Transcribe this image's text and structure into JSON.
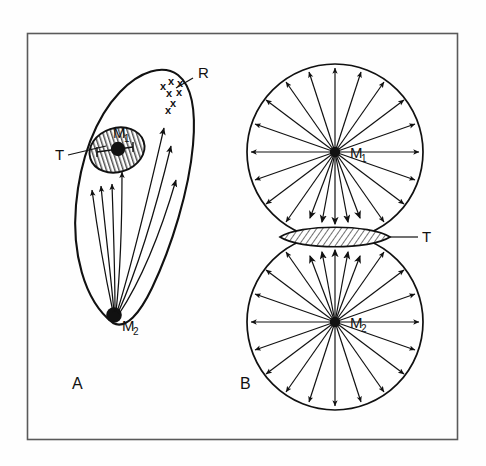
{
  "figure": {
    "background_color": "#fefefe",
    "frame": {
      "name": "outer-frame",
      "x": 27,
      "y": 33,
      "width": 431,
      "height": 407,
      "stroke": "#555555"
    },
    "panels": [
      {
        "id": "A",
        "label": "A",
        "label_x": 72,
        "label_y": 389,
        "description": "Elongated leaf-shaped region R containing hatched target area T with metastasis M1, and primary tumour M2 at the base, with arrows indicating flow from M2 towards M1 and towards the x-marked zone.",
        "outline_name": "region-r-outline",
        "elements": {
          "label_R": "R",
          "label_R_x": 198,
          "label_R_y": 74,
          "label_T": "T",
          "label_T_x": 57,
          "label_T_y": 156,
          "label_M1": "M",
          "label_M1_sub": "1",
          "label_M1_x": 115,
          "label_M1_y": 136,
          "label_M2": "M",
          "label_M2_sub": "2",
          "label_M2_x": 122,
          "label_M2_y": 328,
          "x_marks_count": 7
        }
      },
      {
        "id": "B",
        "label": "B",
        "label_x": 240,
        "label_y": 389,
        "description": "Two tangent circles with radial arrows emanating from their centres M1 (upper) and M2 (lower); the overlapping hatched lens between them is the shared target region T.",
        "elements": {
          "label_M1": "M",
          "label_M1_sub": "1",
          "label_M1_x": 352,
          "label_M1_y": 158,
          "label_M2": "M",
          "label_M2_sub": "2",
          "label_M2_x": 352,
          "label_M2_y": 328,
          "label_T": "T",
          "label_T_x": 424,
          "label_T_y": 242,
          "circle_upper": {
            "cx": 335,
            "cy": 152,
            "r": 88,
            "center_label": "M1"
          },
          "circle_lower": {
            "cx": 335,
            "cy": 322,
            "r": 88,
            "center_label": "M2"
          },
          "lens_T": {
            "cx": 335,
            "cy": 237,
            "rx": 55,
            "ry": 13
          },
          "upper_ray_count": 20,
          "lower_ray_count": 20
        }
      }
    ]
  },
  "legend_keys": {
    "M1": "metastasis / secondary mass",
    "M2": "primary mass",
    "T": "target (hatched) region",
    "R": "region outline",
    "x": "cell cluster marker"
  }
}
